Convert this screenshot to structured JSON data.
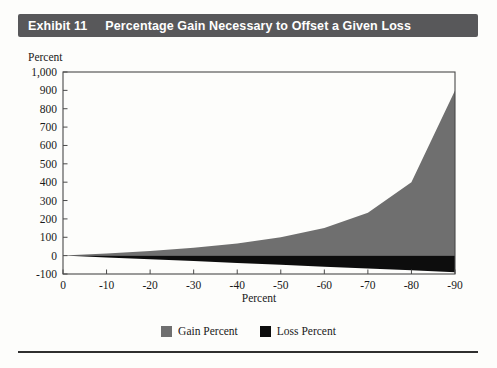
{
  "header": {
    "exhibit_label": "Exhibit 11",
    "title": "Percentage Gain Necessary to Offset a Given Loss",
    "bg_color": "#58585a",
    "text_color": "#ffffff"
  },
  "chart_data": {
    "type": "area",
    "title": "Percentage Gain Necessary to Offset a Given Loss",
    "xlabel": "Percent",
    "ylabel": "Percent",
    "x": [
      0,
      -10,
      -20,
      -30,
      -40,
      -50,
      -60,
      -70,
      -80,
      -90
    ],
    "series": [
      {
        "name": "Gain Percent",
        "color": "#6f6f6f",
        "values": [
          0,
          11.1,
          25,
          42.9,
          66.7,
          100,
          150,
          233.3,
          400,
          900
        ]
      },
      {
        "name": "Loss Percent",
        "color": "#0d0d0d",
        "values": [
          0,
          -10,
          -20,
          -30,
          -40,
          -50,
          -60,
          -70,
          -80,
          -90
        ]
      }
    ],
    "ylim": [
      -100,
      1000
    ],
    "xlim": [
      0,
      -90
    ],
    "ytick_values": [
      -100,
      0,
      100,
      200,
      300,
      400,
      500,
      600,
      700,
      800,
      900,
      1000
    ],
    "ytick_labels": [
      "-100",
      "0",
      "100",
      "200",
      "300",
      "400",
      "500",
      "600",
      "700",
      "800",
      "900",
      "1,000"
    ],
    "xtick_labels": [
      "0",
      "-10",
      "-20",
      "-30",
      "-40",
      "-50",
      "-60",
      "-70",
      "-80",
      "-90"
    ],
    "grid": false,
    "legend_position": "bottom",
    "legend": [
      {
        "label": "Gain Percent",
        "color": "#6f6f6f"
      },
      {
        "label": "Loss Percent",
        "color": "#0d0d0d"
      }
    ],
    "axis_color": "#4a4a4a",
    "tick_label_color": "#1a1a1a"
  }
}
